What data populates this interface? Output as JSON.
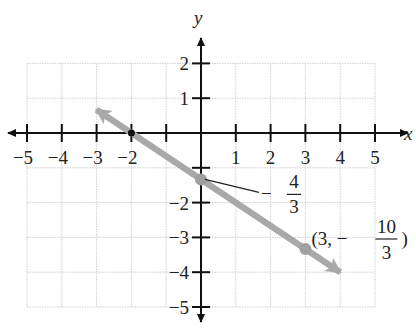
{
  "chart_data": {
    "type": "line",
    "title": "",
    "xlabel": "x",
    "ylabel": "y",
    "xlim": [
      -5,
      5
    ],
    "ylim": [
      -5,
      2
    ],
    "grid": true,
    "x_ticks": [
      -5,
      -4,
      -3,
      -2,
      1,
      2,
      3,
      4,
      5
    ],
    "y_ticks": [
      2,
      1,
      -2,
      -3,
      -4,
      -5
    ],
    "x_tick_labels": [
      "−5",
      "−4",
      "−3",
      "−2",
      "1",
      "2",
      "3",
      "4",
      "5"
    ],
    "y_tick_labels": [
      "2",
      "1",
      "−2",
      "−3",
      "−4",
      "−5"
    ],
    "series": [
      {
        "name": "line",
        "equation": "y = -2/3 x - 4/3",
        "color": "#a9a9a9",
        "x": [
          -3,
          4
        ],
        "y": [
          0.667,
          -4
        ],
        "arrows": "both"
      }
    ],
    "points": [
      {
        "x": 0,
        "y": -1.333,
        "label": "−4/3",
        "label_num": "4",
        "label_den": "3",
        "label_sign": "−"
      },
      {
        "x": 3,
        "y": -3.333,
        "label": "(3, −10/3)",
        "label_prefix": "(3, −",
        "label_num": "10",
        "label_den": "3",
        "label_suffix": ")"
      }
    ],
    "x_intercept": -2
  }
}
